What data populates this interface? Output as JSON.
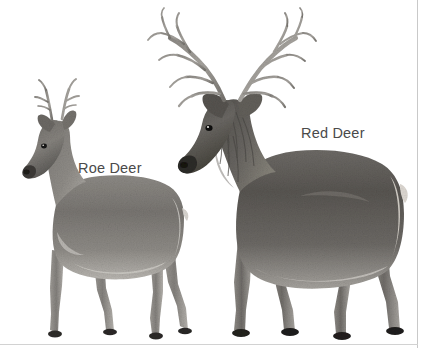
{
  "figure": {
    "style": "grayscale pencil drawing",
    "background_color": "#ffffff",
    "label_color": "#4a4a4a",
    "border_color": "#c9c9c9",
    "width": 435,
    "height": 353
  },
  "labels": {
    "roe_deer": "Roe Deer",
    "red_deer": "Red Deer"
  },
  "subjects": [
    {
      "name": "Roe Deer",
      "position": "left",
      "relative_size": "smaller",
      "antlers": "short, three-tined, upright",
      "label": "Roe Deer"
    },
    {
      "name": "Red Deer",
      "position": "right",
      "relative_size": "larger",
      "antlers": "large, many-tined, branching stag antlers",
      "neck": "shaggy mane",
      "label": "Red Deer"
    }
  ],
  "icons": {
    "roe_deer": "roe-deer-illustration",
    "red_deer": "red-deer-illustration"
  }
}
